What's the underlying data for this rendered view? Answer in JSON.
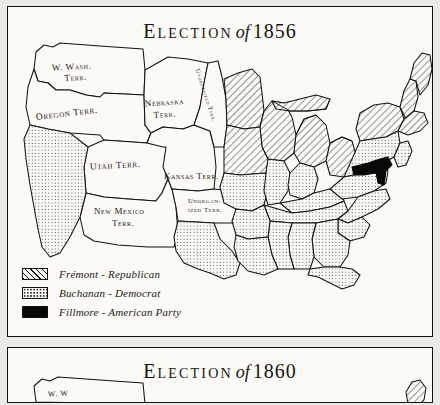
{
  "page": {
    "background": "#eceae6",
    "ink": "#15130f",
    "paper": "#fbfaf7"
  },
  "panels": [
    {
      "id": "1856",
      "title": {
        "word": "Election",
        "of": "of",
        "year": "1856"
      }
    },
    {
      "id": "1860",
      "title": {
        "word": "Election",
        "of": "of",
        "year": "1860"
      }
    }
  ],
  "legend": {
    "items": [
      {
        "pattern": "diagonal-hatch",
        "label": "Frémont - Republican",
        "color": "#15130f"
      },
      {
        "pattern": "stipple",
        "label": "Buchanan - Democrat",
        "color": "#2a2620"
      },
      {
        "pattern": "solid-black",
        "label": "Fillmore - American Party",
        "color": "#090807"
      }
    ]
  },
  "territories": [
    {
      "name": "w-wash-terr",
      "lines": [
        "W. Wash.",
        "Terr."
      ]
    },
    {
      "name": "oregon-terr",
      "lines": [
        "Oregon Terr."
      ]
    },
    {
      "name": "utah-terr",
      "lines": [
        "Utah  Terr."
      ]
    },
    {
      "name": "new-mexico-terr",
      "lines": [
        "New Mexico",
        "Terr."
      ]
    },
    {
      "name": "nebraska-terr",
      "lines": [
        "Nebraska",
        "Terr."
      ]
    },
    {
      "name": "kansas-terr",
      "lines": [
        "Kansas Terr."
      ]
    },
    {
      "name": "unorganized-terr-north",
      "lines": [
        "Unorganized Terr."
      ]
    },
    {
      "name": "unorganized-terr-south",
      "lines": [
        "Unorgan-",
        "ized Terr."
      ]
    }
  ],
  "regions_1856": {
    "fremont_republican": [
      "Maine",
      "New Hampshire",
      "Vermont",
      "Massachusetts",
      "Rhode Island",
      "Connecticut",
      "New York",
      "Michigan",
      "Wisconsin",
      "Iowa",
      "Ohio"
    ],
    "buchanan_democrat": [
      "California",
      "Texas",
      "Louisiana",
      "Arkansas",
      "Missouri",
      "Mississippi",
      "Alabama",
      "Georgia",
      "Florida",
      "South Carolina",
      "North Carolina",
      "Tennessee",
      "Kentucky",
      "Virginia",
      "Illinois",
      "Indiana",
      "Pennsylvania",
      "New Jersey",
      "Delaware"
    ],
    "fillmore_american": [
      "Maryland"
    ]
  }
}
